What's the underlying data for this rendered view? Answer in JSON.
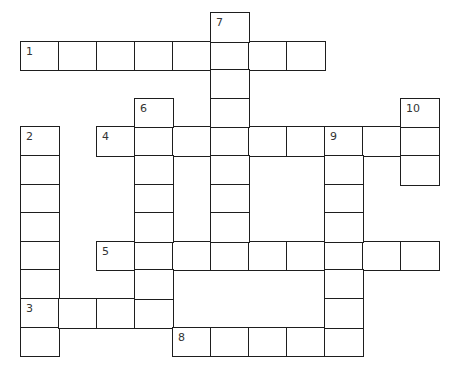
{
  "puzzle": {
    "type": "crossword",
    "grid": {
      "origin_x": 21,
      "origin_y": 13,
      "cell_width": 38,
      "cell_height": 28.6,
      "line_color": "#1e1e1e",
      "number_color": "#333333"
    },
    "entries": [
      {
        "number": "1",
        "direction": "across",
        "row": 1,
        "col": 0,
        "length": 8
      },
      {
        "number": "2",
        "direction": "down",
        "row": 4,
        "col": 0,
        "length": 8
      },
      {
        "number": "3",
        "direction": "across",
        "row": 10,
        "col": 0,
        "length": 4
      },
      {
        "number": "4",
        "direction": "across",
        "row": 4,
        "col": 2,
        "length": 9
      },
      {
        "number": "5",
        "direction": "across",
        "row": 8,
        "col": 2,
        "length": 9
      },
      {
        "number": "6",
        "direction": "down",
        "row": 3,
        "col": 3,
        "length": 8
      },
      {
        "number": "7",
        "direction": "down",
        "row": 0,
        "col": 5,
        "length": 9
      },
      {
        "number": "8",
        "direction": "across",
        "row": 11,
        "col": 4,
        "length": 5
      },
      {
        "number": "9",
        "direction": "down",
        "row": 4,
        "col": 8,
        "length": 8
      },
      {
        "number": "10",
        "direction": "down",
        "row": 3,
        "col": 10,
        "length": 3
      }
    ]
  }
}
